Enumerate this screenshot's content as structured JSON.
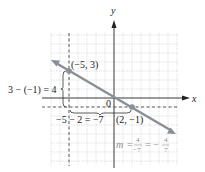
{
  "diagram": {
    "type": "coordinate-plane-slope",
    "axes": {
      "x_label": "x",
      "y_label": "y",
      "origin_label": "0"
    },
    "grid": {
      "xmin": -7,
      "xmax": 7,
      "ymin": -7,
      "ymax": 7
    },
    "points": [
      {
        "label": "(−5, 3)",
        "x": -5,
        "y": 3
      },
      {
        "label": "(2, −1)",
        "x": 2,
        "y": -1
      }
    ],
    "rise_label": "3 − (−1) = 4",
    "run_label": "−5 − 2 = −7",
    "slope": {
      "m": "m",
      "eq": "=",
      "num1": "4",
      "den1": "−7",
      "eq2": "= −",
      "num2": "4",
      "den2": "7"
    },
    "colors": {
      "line": "#8a8f95",
      "grid": "#c8c8c8",
      "axis": "#222222"
    }
  }
}
